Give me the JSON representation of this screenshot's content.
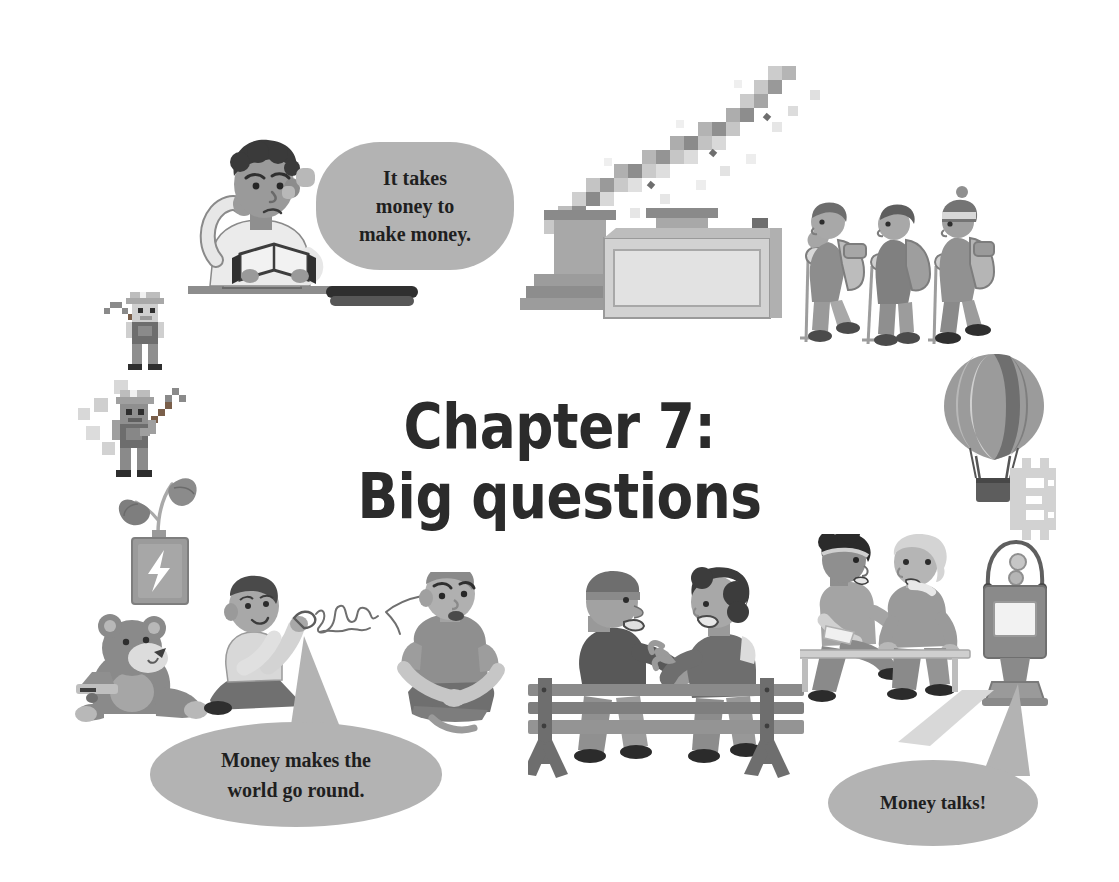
{
  "page": {
    "background_color": "#ffffff",
    "width": 1119,
    "height": 882
  },
  "title": {
    "line1": "Chapter 7:",
    "line2": "Big questions",
    "color": "#2b2b2b"
  },
  "speech_bubbles": [
    {
      "id": "it-takes-money",
      "line1": "It takes",
      "line2": "money to",
      "line3": "make money.",
      "full_text": "It takes money to make money.",
      "type": "thought",
      "fill_color": "#b3b3b3",
      "text_color": "#1f1f1f",
      "speaker": "man-reading-book"
    },
    {
      "id": "money-makes-world",
      "line1": "Money makes the",
      "line2": "world go round.",
      "full_text": "Money makes the world go round.",
      "type": "speech",
      "fill_color": "#b3b3b3",
      "text_color": "#1f1f1f",
      "speaker": "boy-kneeling-drawing"
    },
    {
      "id": "money-talks",
      "line1": "Money talks!",
      "full_text": "Money talks!",
      "type": "speech",
      "fill_color": "#b3b3b3",
      "text_color": "#1f1f1f",
      "speaker": "two-women-on-bench"
    }
  ],
  "illustrations": [
    {
      "id": "man-reading-book",
      "name": "man-reading-book-illustration",
      "description": "Man with curly dark hair sitting at a desk reading an open book, hand to his temple, thinking"
    },
    {
      "id": "factory",
      "name": "factory-illustration",
      "description": "Factory building with two smokestacks emitting pixelated smoke"
    },
    {
      "id": "hikers",
      "name": "hikers-illustration",
      "description": "Three hikers with backpacks and trekking poles walking in a line"
    },
    {
      "id": "hot-air-balloon",
      "name": "hot-air-balloon-illustration",
      "description": "Striped hot-air balloon with wicker basket"
    },
    {
      "id": "bitcoin-symbol",
      "name": "bitcoin-symbol-illustration",
      "description": "Pixel-art Bitcoin currency symbol"
    },
    {
      "id": "pixel-miner-upper",
      "name": "pixel-miner-upper-illustration",
      "description": "Pixel-art miner with hard hat swinging a pickaxe"
    },
    {
      "id": "pixel-miner-lower",
      "name": "pixel-miner-lower-illustration",
      "description": "Pixel-art miner with hard hat raising a pickaxe, floating blocks nearby"
    },
    {
      "id": "battery-plant",
      "name": "battery-plant-illustration",
      "description": "Battery with a lightning bolt and a green sprout growing out of the top"
    },
    {
      "id": "teddy-bear",
      "name": "teddy-bear-illustration",
      "description": "Teddy bear sitting with a small toy"
    },
    {
      "id": "boy-kneeling-drawing",
      "name": "boy-kneeling-illustration",
      "description": "Boy kneeling, holding an object with scribbled squiggle lines"
    },
    {
      "id": "worried-man",
      "name": "worried-man-illustration",
      "description": "Worried young man sitting cross-legged on the ground"
    },
    {
      "id": "couple-on-bench",
      "name": "couple-on-bench-illustration",
      "description": "Elderly man and woman talking on a wooden park bench"
    },
    {
      "id": "two-women-on-bench",
      "name": "two-women-on-bench-illustration",
      "description": "Two women sitting on a bench in conversation, one holding a paper"
    },
    {
      "id": "parking-meter",
      "name": "parking-meter-illustration",
      "description": "Parking meter with a blank display panel"
    }
  ]
}
